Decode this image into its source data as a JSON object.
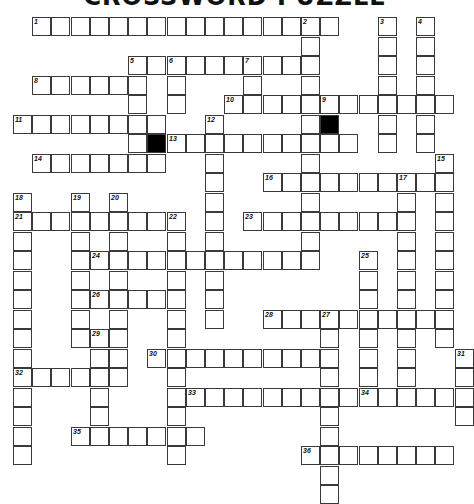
{
  "title": "CROSSWORD PUZZLE",
  "grid": {
    "origin_x": 13,
    "origin_y": 17,
    "cell_w": 19.2,
    "cell_h": 19.5
  },
  "words": [
    {
      "num": 1,
      "dir": "across",
      "row": 0,
      "col": 1,
      "len": 16
    },
    {
      "num": 2,
      "dir": "down",
      "row": 0,
      "col": 15,
      "len": 13
    },
    {
      "num": 3,
      "dir": "down",
      "row": 0,
      "col": 19,
      "len": 7
    },
    {
      "num": 4,
      "dir": "down",
      "row": 0,
      "col": 21,
      "len": 7
    },
    {
      "num": 5,
      "dir": "across",
      "row": 2,
      "col": 6,
      "len": 10
    },
    {
      "num": 5,
      "dir": "down",
      "row": 2,
      "col": 6,
      "len": 6
    },
    {
      "num": 6,
      "dir": "down",
      "row": 2,
      "col": 8,
      "len": 3
    },
    {
      "num": 7,
      "dir": "down",
      "row": 2,
      "col": 12,
      "len": 3
    },
    {
      "num": 8,
      "dir": "across",
      "row": 3,
      "col": 1,
      "len": 6
    },
    {
      "num": 9,
      "dir": "down",
      "row": 4,
      "col": 16,
      "len": 3
    },
    {
      "num": 10,
      "dir": "across",
      "row": 4,
      "col": 11,
      "len": 12
    },
    {
      "num": 11,
      "dir": "across",
      "row": 5,
      "col": 0,
      "len": 8
    },
    {
      "num": 12,
      "dir": "down",
      "row": 5,
      "col": 10,
      "len": 11
    },
    {
      "num": 13,
      "dir": "across",
      "row": 6,
      "col": 8,
      "len": 10
    },
    {
      "num": 14,
      "dir": "across",
      "row": 7,
      "col": 1,
      "len": 7
    },
    {
      "num": 15,
      "dir": "down",
      "row": 7,
      "col": 22,
      "len": 10
    },
    {
      "num": 16,
      "dir": "across",
      "row": 8,
      "col": 13,
      "len": 10
    },
    {
      "num": 17,
      "dir": "down",
      "row": 8,
      "col": 20,
      "len": 11
    },
    {
      "num": 18,
      "dir": "down",
      "row": 9,
      "col": 0,
      "len": 14
    },
    {
      "num": 19,
      "dir": "down",
      "row": 9,
      "col": 3,
      "len": 8
    },
    {
      "num": 20,
      "dir": "down",
      "row": 9,
      "col": 5,
      "len": 9
    },
    {
      "num": 21,
      "dir": "across",
      "row": 10,
      "col": 0,
      "len": 8
    },
    {
      "num": 22,
      "dir": "down",
      "row": 10,
      "col": 8,
      "len": 13
    },
    {
      "num": 23,
      "dir": "across",
      "row": 10,
      "col": 12,
      "len": 8
    },
    {
      "num": 24,
      "dir": "across",
      "row": 12,
      "col": 4,
      "len": 11
    },
    {
      "num": 25,
      "dir": "down",
      "row": 12,
      "col": 18,
      "len": 8
    },
    {
      "num": 26,
      "dir": "across",
      "row": 14,
      "col": 4,
      "len": 5
    },
    {
      "num": 27,
      "dir": "down",
      "row": 15,
      "col": 16,
      "len": 10
    },
    {
      "num": 28,
      "dir": "across",
      "row": 15,
      "col": 13,
      "len": 10
    },
    {
      "num": 29,
      "dir": "down",
      "row": 16,
      "col": 4,
      "len": 6
    },
    {
      "num": 30,
      "dir": "across",
      "row": 17,
      "col": 7,
      "len": 9
    },
    {
      "num": 31,
      "dir": "down",
      "row": 17,
      "col": 23,
      "len": 4
    },
    {
      "num": 32,
      "dir": "across",
      "row": 18,
      "col": 0,
      "len": 6
    },
    {
      "num": 33,
      "dir": "across",
      "row": 19,
      "col": 9,
      "len": 9
    },
    {
      "num": 34,
      "dir": "across",
      "row": 19,
      "col": 18,
      "len": 6
    },
    {
      "num": 35,
      "dir": "across",
      "row": 21,
      "col": 3,
      "len": 7
    },
    {
      "num": 36,
      "dir": "across",
      "row": 22,
      "col": 15,
      "len": 8
    }
  ],
  "black_cells": [
    {
      "row": 6,
      "col": 7
    },
    {
      "row": 5,
      "col": 16
    }
  ]
}
